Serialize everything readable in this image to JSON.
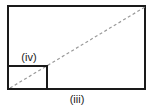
{
  "diagram": {
    "outer_rect": {
      "x": 8,
      "y": 6,
      "width": 137,
      "height": 83,
      "label": "(iii)"
    },
    "inner_rect": {
      "x": 8,
      "y": 66,
      "width": 39,
      "height": 23,
      "label": "(iv)"
    },
    "diagonal": {
      "x1": 10,
      "y1": 88,
      "x2": 145,
      "y2": 7,
      "style": "dashed"
    },
    "colors": {
      "stroke": "#1a1a1a",
      "dash": "#9a9a9a",
      "text": "#222222"
    }
  }
}
